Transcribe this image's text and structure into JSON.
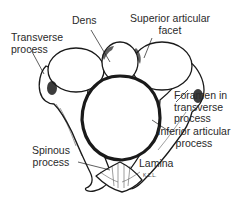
{
  "figure": {
    "signature": "K.Z.L.",
    "colors": {
      "ink": "#1a1a1a",
      "background": "#ffffff",
      "label": "#2a2a2a"
    }
  },
  "labels": [
    {
      "id": "dens",
      "line1": "Dens",
      "line2": ""
    },
    {
      "id": "transverse-process",
      "line1": "Transverse",
      "line2": "process"
    },
    {
      "id": "superior-articular-facet",
      "line1": "Superior articular",
      "line2": "facet"
    },
    {
      "id": "foramen-in-transverse-process",
      "line1": "Foramen in",
      "line2": "transverse",
      "line3": "process"
    },
    {
      "id": "inferior-articular-process",
      "line1": "Inferior articular",
      "line2": "process"
    },
    {
      "id": "spinous-process",
      "line1": "Spinous",
      "line2": "process"
    },
    {
      "id": "lamina",
      "line1": "Lamina",
      "line2": ""
    }
  ]
}
